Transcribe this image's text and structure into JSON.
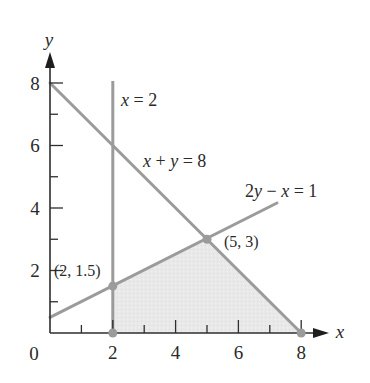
{
  "figure": {
    "type": "linear-programming feasible region",
    "axes": {
      "x_label": "x",
      "y_label": "y",
      "origin_label": "0",
      "x_ticks": [
        "2",
        "4",
        "6",
        "8"
      ],
      "y_ticks": [
        "2",
        "4",
        "6",
        "8"
      ],
      "x_range": [
        0,
        8
      ],
      "y_range": [
        0,
        8
      ],
      "minor_tick_step": 1
    },
    "lines": [
      {
        "id": "vertical",
        "label_var": "x",
        "label_rest": " = 2",
        "equation": "x = 2"
      },
      {
        "id": "diagonal",
        "label_a": "x",
        "label_op1": " + ",
        "label_b": "y",
        "label_rest": " = 8",
        "equation": "x + y = 8"
      },
      {
        "id": "slope",
        "label_a": "2",
        "label_b": "y",
        "label_op": " − ",
        "label_c": "x",
        "label_rest": " = 1",
        "equation": "2y − x = 1"
      }
    ],
    "points": [
      {
        "label": "(2, 1.5)",
        "x": 2,
        "y": 1.5
      },
      {
        "label": "(5, 3)",
        "x": 5,
        "y": 3
      },
      {
        "label": "",
        "x": 2,
        "y": 0
      },
      {
        "label": "",
        "x": 8,
        "y": 0
      }
    ],
    "feasible_region": {
      "vertices": [
        [
          2,
          0
        ],
        [
          2,
          1.5
        ],
        [
          5,
          3
        ],
        [
          8,
          0
        ]
      ],
      "fill_color": "#e6e6e6"
    },
    "colors": {
      "constraint_line": "#9b9b9b",
      "axis": "#2e2e2e",
      "point": "#9b9b9b"
    }
  }
}
